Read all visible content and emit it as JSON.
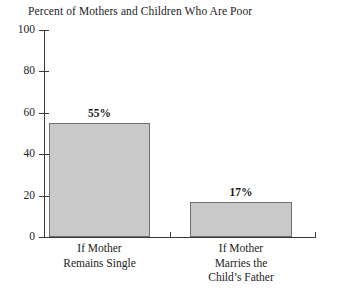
{
  "chart_data": {
    "type": "bar",
    "title": "Percent of Mothers and Children Who Are Poor",
    "xlabel": "",
    "ylabel": "",
    "ylim": [
      0,
      100
    ],
    "yticks": [
      0,
      20,
      40,
      60,
      80,
      100
    ],
    "ytick_labels": [
      "0",
      "20",
      "40",
      "60",
      "80",
      "100"
    ],
    "grid": false,
    "legend": false,
    "legend_position": "none",
    "categories": [
      "If Mother Remains Single",
      "If Mother Marries the Child's Father"
    ],
    "category_lines": [
      [
        "If Mother",
        "Remains Single"
      ],
      [
        "If Mother",
        "Marries the",
        "Child’s Father"
      ]
    ],
    "values": [
      55,
      17
    ],
    "value_labels": [
      "55%",
      "17%"
    ],
    "bar_fill_color": "#c9c9c9",
    "bar_border_color": "#6f6f6f",
    "axis_color": "#3a3a3a",
    "text_color": "#232323",
    "background_color": "#ffffff"
  }
}
